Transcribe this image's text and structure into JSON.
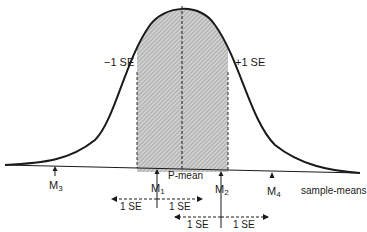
{
  "diagram": {
    "type": "normal-distribution-sampling",
    "curve_label_minus": "−1 SE",
    "curve_label_plus": "+1 SE",
    "population_mean_label": "P-mean",
    "axis_label": "sample-means",
    "sample_means": [
      {
        "id": "M3",
        "base": "M",
        "sub": "3"
      },
      {
        "id": "M1",
        "base": "M",
        "sub": "1"
      },
      {
        "id": "M2",
        "base": "M",
        "sub": "2"
      },
      {
        "id": "M4",
        "base": "M",
        "sub": "4"
      }
    ],
    "intervals": [
      {
        "around": "M1",
        "left_label": "1 SE",
        "right_label": "1 SE"
      },
      {
        "around": "M2",
        "left_label": "1 SE",
        "right_label": "1 SE"
      }
    ],
    "colors": {
      "line": "#1a1a1a",
      "shade": "#bdbdbd",
      "background": "#ffffff"
    }
  }
}
